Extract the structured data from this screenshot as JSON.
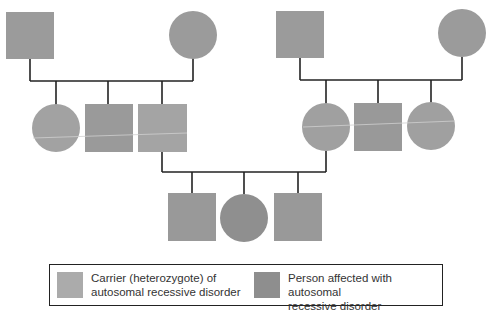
{
  "diagram": {
    "type": "pedigree",
    "colors": {
      "carrier": "#a9a9a9",
      "affected": "#8f8f8f",
      "line": "#222222",
      "separator": "#c8c8c8"
    },
    "generations": [
      {
        "label": "I",
        "individuals": [
          {
            "id": "I-1",
            "sex": "male",
            "status": "carrier"
          },
          {
            "id": "I-2",
            "sex": "female",
            "status": "carrier"
          },
          {
            "id": "I-3",
            "sex": "male",
            "status": "carrier"
          },
          {
            "id": "I-4",
            "sex": "female",
            "status": "carrier"
          }
        ]
      },
      {
        "label": "II",
        "individuals": [
          {
            "id": "II-1",
            "sex": "female",
            "status": "carrier_or_normal"
          },
          {
            "id": "II-2",
            "sex": "male",
            "status": "carrier_or_normal"
          },
          {
            "id": "II-3",
            "sex": "male",
            "status": "carrier"
          },
          {
            "id": "II-4",
            "sex": "female",
            "status": "carrier"
          },
          {
            "id": "II-5",
            "sex": "male",
            "status": "carrier_or_normal"
          },
          {
            "id": "II-6",
            "sex": "female",
            "status": "carrier_or_normal"
          }
        ]
      },
      {
        "label": "III",
        "individuals": [
          {
            "id": "III-1",
            "sex": "male",
            "status": "affected"
          },
          {
            "id": "III-2",
            "sex": "female",
            "status": "affected"
          },
          {
            "id": "III-3",
            "sex": "male",
            "status": "affected"
          }
        ]
      }
    ]
  },
  "legend": {
    "carrier_label": "Carrier (heterozygote) of autosomal recessive disorder",
    "carrier_line1": "Carrier (heterozygote) of",
    "carrier_line2": "autosomal recessive disorder",
    "affected_line1": "Person affected with autosomal",
    "affected_line2": "recessive disorder"
  }
}
